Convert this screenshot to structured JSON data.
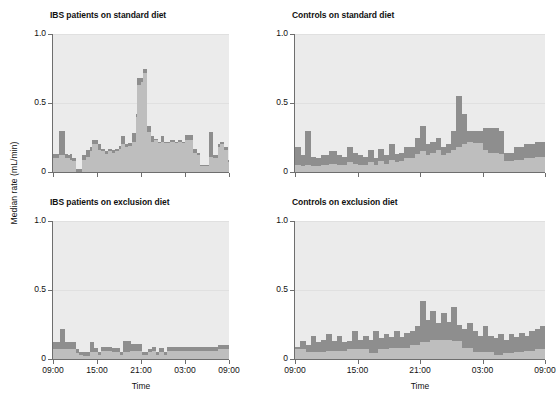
{
  "figure": {
    "ylabel": "Median rate (mL/min)",
    "xlabel": "Time",
    "yticks": [
      "0",
      "0.5",
      "1.0"
    ],
    "xticks": [
      "09:00",
      "15:00",
      "21:00",
      "03:00",
      "09:00"
    ],
    "colors": {
      "panel_background": "#ebebeb",
      "dark_series": "#8e8e8e",
      "light_series": "#bebebe",
      "axis": "#6e6e6e",
      "grid": "#e0e0e0"
    }
  },
  "chart_data": {
    "type": "bar",
    "title": "",
    "xlabel": "Time",
    "ylabel": "Median rate (mL/min)",
    "ylim": [
      0,
      1.0
    ],
    "yticks": [
      0,
      0.5,
      1.0
    ],
    "xtick_labels": [
      "09:00",
      "15:00",
      "21:00",
      "03:00",
      "09:00"
    ],
    "xtick_positions": [
      0,
      6,
      12,
      18,
      24
    ],
    "xlim": [
      0,
      24
    ],
    "grid": true,
    "legend": "none",
    "x_hours": [
      0,
      0.25,
      0.5,
      0.75,
      1,
      1.25,
      1.5,
      1.75,
      2,
      2.25,
      2.5,
      2.75,
      3,
      3.25,
      3.5,
      3.75,
      4,
      4.25,
      4.5,
      4.75,
      5,
      5.25,
      5.5,
      5.75,
      6,
      6.25,
      6.5,
      6.75,
      7,
      7.25,
      7.5,
      7.75,
      8,
      8.25,
      8.5,
      8.75,
      9,
      9.25,
      9.5,
      9.75,
      10,
      10.25,
      10.5,
      10.75,
      11,
      11.25,
      11.5,
      11.75,
      12,
      12.25,
      12.5,
      12.75,
      13,
      13.25,
      13.5,
      13.75,
      14,
      14.25,
      14.5,
      14.75,
      15,
      15.25,
      15.5,
      15.75,
      16,
      16.25,
      16.5,
      16.75,
      17,
      17.25,
      17.5,
      17.75,
      18,
      18.25,
      18.5,
      18.75,
      19,
      19.25,
      19.5,
      19.75,
      20,
      20.25,
      20.5,
      20.75,
      21,
      21.25,
      21.5,
      21.75,
      22,
      22.25,
      22.5,
      22.75,
      23,
      23.25,
      23.5,
      23.75
    ],
    "panels": [
      {
        "id": "ibs-standard",
        "title": "IBS patients on standard diet",
        "position": "top-left",
        "series": [
          {
            "name": "dark",
            "values": [
              0.13,
              0.13,
              0.13,
              0.3,
              0.3,
              0.3,
              0.13,
              0.13,
              0.12,
              0.13,
              0.1,
              0.1,
              0.02,
              0.02,
              0.02,
              0.02,
              0.12,
              0.12,
              0.16,
              0.16,
              0.18,
              0.23,
              0.23,
              0.23,
              0.2,
              0.2,
              0.17,
              0.17,
              0.15,
              0.15,
              0.17,
              0.17,
              0.16,
              0.16,
              0.17,
              0.17,
              0.19,
              0.26,
              0.26,
              0.2,
              0.2,
              0.21,
              0.21,
              0.28,
              0.28,
              0.42,
              0.68,
              0.68,
              0.68,
              0.75,
              0.75,
              0.33,
              0.33,
              0.26,
              0.26,
              0.24,
              0.24,
              0.22,
              0.22,
              0.26,
              0.22,
              0.22,
              0.22,
              0.22,
              0.23,
              0.23,
              0.22,
              0.22,
              0.23,
              0.23,
              0.22,
              0.22,
              0.27,
              0.27,
              0.27,
              0.27,
              0.17,
              0.17,
              0.14,
              0.14,
              0.05,
              0.05,
              0.05,
              0.05,
              0.05,
              0.29,
              0.29,
              0.12,
              0.12,
              0.12,
              0.2,
              0.22,
              0.22,
              0.18,
              0.18,
              0.09
            ]
          },
          {
            "name": "light",
            "values": [
              0.1,
              0.1,
              0.1,
              0.12,
              0.12,
              0.12,
              0.1,
              0.1,
              0.1,
              0.09,
              0.08,
              0.08,
              0.0,
              0.0,
              0.0,
              0.0,
              0.09,
              0.09,
              0.11,
              0.11,
              0.15,
              0.2,
              0.2,
              0.2,
              0.16,
              0.16,
              0.15,
              0.15,
              0.13,
              0.13,
              0.15,
              0.15,
              0.14,
              0.14,
              0.15,
              0.15,
              0.17,
              0.2,
              0.2,
              0.18,
              0.18,
              0.19,
              0.19,
              0.22,
              0.22,
              0.4,
              0.63,
              0.63,
              0.65,
              0.72,
              0.72,
              0.29,
              0.29,
              0.22,
              0.22,
              0.23,
              0.23,
              0.21,
              0.21,
              0.22,
              0.21,
              0.21,
              0.21,
              0.21,
              0.22,
              0.22,
              0.21,
              0.21,
              0.22,
              0.22,
              0.21,
              0.21,
              0.23,
              0.23,
              0.23,
              0.23,
              0.14,
              0.14,
              0.12,
              0.12,
              0.04,
              0.04,
              0.04,
              0.04,
              0.04,
              0.11,
              0.11,
              0.1,
              0.1,
              0.1,
              0.18,
              0.2,
              0.2,
              0.16,
              0.16,
              0.07
            ]
          }
        ]
      },
      {
        "id": "controls-standard",
        "title": "Controls on standard diet",
        "position": "top-right",
        "series": [
          {
            "name": "dark",
            "values": [
              0.18,
              0.18,
              0.12,
              0.12,
              0.3,
              0.3,
              0.11,
              0.11,
              0.1,
              0.1,
              0.12,
              0.12,
              0.12,
              0.15,
              0.15,
              0.15,
              0.12,
              0.12,
              0.11,
              0.11,
              0.18,
              0.18,
              0.14,
              0.14,
              0.12,
              0.12,
              0.11,
              0.11,
              0.16,
              0.16,
              0.1,
              0.1,
              0.17,
              0.17,
              0.12,
              0.12,
              0.2,
              0.2,
              0.13,
              0.13,
              0.14,
              0.14,
              0.18,
              0.18,
              0.18,
              0.18,
              0.25,
              0.25,
              0.33,
              0.33,
              0.2,
              0.2,
              0.22,
              0.22,
              0.25,
              0.25,
              0.18,
              0.18,
              0.2,
              0.2,
              0.3,
              0.3,
              0.55,
              0.55,
              0.42,
              0.42,
              0.3,
              0.3,
              0.3,
              0.3,
              0.3,
              0.3,
              0.32,
              0.32,
              0.32,
              0.32,
              0.32,
              0.32,
              0.3,
              0.3,
              0.14,
              0.14,
              0.14,
              0.14,
              0.18,
              0.18,
              0.18,
              0.18,
              0.2,
              0.2,
              0.2,
              0.2,
              0.22,
              0.22,
              0.22,
              0.22
            ]
          },
          {
            "name": "light",
            "values": [
              0.05,
              0.05,
              0.04,
              0.04,
              0.05,
              0.05,
              0.04,
              0.04,
              0.04,
              0.04,
              0.05,
              0.05,
              0.05,
              0.06,
              0.06,
              0.06,
              0.05,
              0.05,
              0.05,
              0.05,
              0.07,
              0.07,
              0.06,
              0.06,
              0.05,
              0.05,
              0.05,
              0.05,
              0.07,
              0.07,
              0.05,
              0.05,
              0.08,
              0.08,
              0.06,
              0.06,
              0.09,
              0.09,
              0.07,
              0.07,
              0.08,
              0.08,
              0.1,
              0.1,
              0.1,
              0.1,
              0.13,
              0.13,
              0.15,
              0.15,
              0.12,
              0.12,
              0.14,
              0.14,
              0.16,
              0.16,
              0.12,
              0.12,
              0.14,
              0.14,
              0.16,
              0.16,
              0.18,
              0.18,
              0.2,
              0.2,
              0.22,
              0.22,
              0.21,
              0.21,
              0.21,
              0.21,
              0.16,
              0.16,
              0.14,
              0.14,
              0.14,
              0.14,
              0.13,
              0.13,
              0.08,
              0.08,
              0.08,
              0.08,
              0.09,
              0.09,
              0.09,
              0.09,
              0.1,
              0.1,
              0.1,
              0.1,
              0.11,
              0.11,
              0.11,
              0.11
            ]
          }
        ]
      },
      {
        "id": "ibs-exclusion",
        "title": "IBS patients on exclusion diet",
        "position": "bottom-left",
        "series": [
          {
            "name": "dark",
            "values": [
              0.12,
              0.12,
              0.12,
              0.12,
              0.22,
              0.22,
              0.12,
              0.12,
              0.12,
              0.12,
              0.12,
              0.12,
              0.07,
              0.07,
              0.05,
              0.05,
              0.05,
              0.05,
              0.05,
              0.05,
              0.12,
              0.12,
              0.08,
              0.08,
              0.05,
              0.05,
              0.09,
              0.09,
              0.09,
              0.09,
              0.09,
              0.09,
              0.08,
              0.08,
              0.08,
              0.08,
              0.05,
              0.05,
              0.13,
              0.13,
              0.13,
              0.13,
              0.11,
              0.11,
              0.11,
              0.11,
              0.11,
              0.11,
              0.05,
              0.05,
              0.05,
              0.05,
              0.07,
              0.07,
              0.09,
              0.09,
              0.05,
              0.05,
              0.08,
              0.08,
              0.05,
              0.05,
              0.09,
              0.09,
              0.09,
              0.09,
              0.09,
              0.09,
              0.09,
              0.09,
              0.09,
              0.09,
              0.09,
              0.09,
              0.09,
              0.09,
              0.09,
              0.09,
              0.09,
              0.09,
              0.09,
              0.09,
              0.09,
              0.09,
              0.09,
              0.09,
              0.09,
              0.09,
              0.09,
              0.09,
              0.1,
              0.1,
              0.1,
              0.1,
              0.1,
              0.1
            ]
          },
          {
            "name": "light",
            "values": [
              0.07,
              0.07,
              0.07,
              0.07,
              0.07,
              0.07,
              0.07,
              0.07,
              0.07,
              0.07,
              0.07,
              0.07,
              0.04,
              0.04,
              0.03,
              0.03,
              0.02,
              0.02,
              0.02,
              0.02,
              0.05,
              0.05,
              0.05,
              0.05,
              0.03,
              0.03,
              0.06,
              0.06,
              0.06,
              0.06,
              0.06,
              0.06,
              0.05,
              0.05,
              0.05,
              0.05,
              0.03,
              0.03,
              0.05,
              0.05,
              0.05,
              0.05,
              0.06,
              0.06,
              0.06,
              0.06,
              0.06,
              0.06,
              0.03,
              0.03,
              0.03,
              0.03,
              0.05,
              0.05,
              0.06,
              0.06,
              0.03,
              0.03,
              0.05,
              0.05,
              0.03,
              0.03,
              0.06,
              0.06,
              0.06,
              0.06,
              0.06,
              0.06,
              0.06,
              0.06,
              0.06,
              0.06,
              0.06,
              0.06,
              0.06,
              0.06,
              0.06,
              0.06,
              0.06,
              0.06,
              0.06,
              0.06,
              0.06,
              0.06,
              0.06,
              0.06,
              0.06,
              0.06,
              0.06,
              0.06,
              0.07,
              0.07,
              0.07,
              0.07,
              0.07,
              0.07
            ]
          }
        ]
      },
      {
        "id": "controls-exclusion",
        "title": "Controls on exclusion diet",
        "position": "bottom-right",
        "series": [
          {
            "name": "dark",
            "values": [
              0.09,
              0.09,
              0.13,
              0.13,
              0.1,
              0.1,
              0.17,
              0.17,
              0.12,
              0.12,
              0.14,
              0.14,
              0.18,
              0.18,
              0.13,
              0.13,
              0.17,
              0.17,
              0.12,
              0.12,
              0.13,
              0.13,
              0.2,
              0.2,
              0.14,
              0.14,
              0.17,
              0.17,
              0.14,
              0.14,
              0.2,
              0.2,
              0.15,
              0.15,
              0.18,
              0.18,
              0.16,
              0.16,
              0.2,
              0.2,
              0.16,
              0.16,
              0.19,
              0.19,
              0.2,
              0.2,
              0.24,
              0.24,
              0.42,
              0.42,
              0.28,
              0.28,
              0.35,
              0.35,
              0.26,
              0.26,
              0.33,
              0.33,
              0.27,
              0.27,
              0.38,
              0.38,
              0.25,
              0.25,
              0.22,
              0.22,
              0.26,
              0.26,
              0.2,
              0.2,
              0.17,
              0.17,
              0.24,
              0.24,
              0.17,
              0.17,
              0.15,
              0.15,
              0.18,
              0.18,
              0.14,
              0.14,
              0.18,
              0.18,
              0.16,
              0.16,
              0.19,
              0.19,
              0.17,
              0.17,
              0.2,
              0.2,
              0.22,
              0.22,
              0.24,
              0.24
            ]
          },
          {
            "name": "light",
            "values": [
              0.07,
              0.07,
              0.07,
              0.07,
              0.05,
              0.05,
              0.05,
              0.05,
              0.05,
              0.05,
              0.05,
              0.05,
              0.06,
              0.06,
              0.06,
              0.06,
              0.06,
              0.06,
              0.06,
              0.06,
              0.07,
              0.07,
              0.07,
              0.07,
              0.07,
              0.07,
              0.07,
              0.07,
              0.04,
              0.04,
              0.04,
              0.04,
              0.07,
              0.07,
              0.07,
              0.07,
              0.08,
              0.08,
              0.08,
              0.08,
              0.08,
              0.08,
              0.08,
              0.08,
              0.1,
              0.1,
              0.1,
              0.1,
              0.12,
              0.12,
              0.12,
              0.12,
              0.14,
              0.14,
              0.14,
              0.14,
              0.14,
              0.14,
              0.14,
              0.14,
              0.13,
              0.13,
              0.13,
              0.13,
              0.08,
              0.08,
              0.08,
              0.08,
              0.05,
              0.05,
              0.05,
              0.05,
              0.05,
              0.05,
              0.05,
              0.05,
              0.03,
              0.03,
              0.03,
              0.03,
              0.04,
              0.04,
              0.04,
              0.04,
              0.05,
              0.05,
              0.05,
              0.05,
              0.06,
              0.06,
              0.06,
              0.06,
              0.07,
              0.07,
              0.07,
              0.07
            ]
          }
        ]
      }
    ]
  }
}
